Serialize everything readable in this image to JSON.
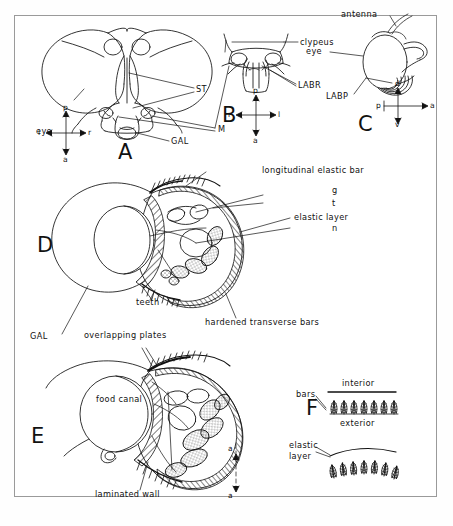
{
  "figure": {
    "panels": [
      "A",
      "B",
      "C",
      "D",
      "E",
      "F"
    ],
    "background_color": "#ffffff",
    "line_color": "#111111",
    "frame_color": "#9a9a9a"
  },
  "panel_a": {
    "letter": "A",
    "view": "frontal head",
    "labels": [
      {
        "name": "eye",
        "text": "eye"
      },
      {
        "name": "st",
        "text": "ST"
      },
      {
        "name": "m",
        "text": "M"
      },
      {
        "name": "gal",
        "text": "GAL"
      }
    ],
    "orientation": {
      "top": "p",
      "left": "l",
      "right": "r",
      "bottom": "a"
    }
  },
  "panel_b": {
    "letter": "B",
    "view": "clypeus and labrum",
    "labels": [
      {
        "name": "clypeus",
        "text": "clypeus"
      },
      {
        "name": "labr",
        "text": "LABR"
      }
    ],
    "orientation": {
      "top": "p",
      "left": "r",
      "right": "l",
      "bottom": "a"
    }
  },
  "panel_c": {
    "letter": "C",
    "view": "lateral head",
    "labels": [
      {
        "name": "antenna",
        "text": "antenna"
      },
      {
        "name": "eye",
        "text": "eye"
      },
      {
        "name": "labp",
        "text": "LABP"
      }
    ],
    "orientation": {
      "top": "d",
      "left": "p",
      "right": "a",
      "bottom": "v"
    }
  },
  "panel_d": {
    "letter": "D",
    "view": "proboscis cross-section, anterior",
    "labels": [
      {
        "name": "longitudinal-elastic-bar",
        "text": "longitudinal elastic bar"
      },
      {
        "name": "g",
        "text": "g"
      },
      {
        "name": "t",
        "text": "t"
      },
      {
        "name": "elastic-layer",
        "text": "elastic layer"
      },
      {
        "name": "n",
        "text": "n"
      },
      {
        "name": "teeth",
        "text": "teeth"
      },
      {
        "name": "gal",
        "text": "GAL"
      },
      {
        "name": "hardened-transverse-bars",
        "text": "hardened transverse bars"
      }
    ]
  },
  "panel_e": {
    "letter": "E",
    "view": "proboscis cross-section, posterior",
    "labels": [
      {
        "name": "overlapping-plates",
        "text": "overlapping plates"
      },
      {
        "name": "food-canal",
        "text": "food canal"
      },
      {
        "name": "laminated-wall",
        "text": "laminated wall"
      },
      {
        "name": "section-top",
        "text": "a"
      },
      {
        "name": "section-bottom",
        "text": "a"
      }
    ]
  },
  "panel_f": {
    "letter": "F",
    "view": "bar detail",
    "labels": [
      {
        "name": "bars",
        "text": "bars"
      },
      {
        "name": "interior",
        "text": "interior"
      },
      {
        "name": "exterior",
        "text": "exterior"
      },
      {
        "name": "elastic-layer",
        "text": "elastic\nlayer"
      },
      {
        "name": "elastic-layer-line1",
        "text": "elastic"
      },
      {
        "name": "elastic-layer-line2",
        "text": "layer"
      }
    ],
    "bars_top_count": 7,
    "bars_bottom_count": 7
  }
}
